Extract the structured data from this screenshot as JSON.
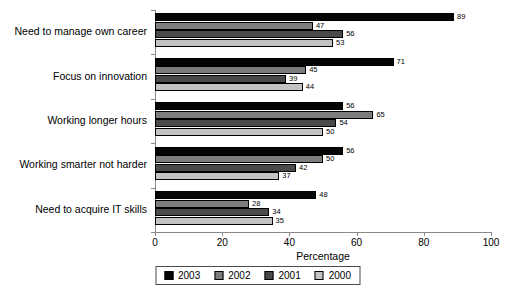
{
  "chart_data": {
    "type": "bar",
    "orientation": "horizontal",
    "title": "",
    "xlabel": "Percentage",
    "ylabel": "",
    "xlim": [
      0,
      100
    ],
    "xticks": [
      0,
      20,
      40,
      60,
      80,
      100
    ],
    "grid": false,
    "legend_position": "bottom",
    "categories": [
      "Need to manage own career",
      "Focus on innovation",
      "Working longer hours",
      "Working smarter not harder",
      "Need to acquire IT skills"
    ],
    "series": [
      {
        "name": "2003",
        "color": "#050505",
        "values": [
          89,
          71,
          56,
          56,
          48
        ]
      },
      {
        "name": "2002",
        "color": "#7d7d7d",
        "values": [
          47,
          45,
          65,
          50,
          28
        ]
      },
      {
        "name": "2001",
        "color": "#4a4a4a",
        "values": [
          56,
          39,
          54,
          42,
          34
        ]
      },
      {
        "name": "2000",
        "color": "#c3c3c3",
        "values": [
          53,
          44,
          50,
          37,
          35
        ]
      }
    ]
  },
  "legend": {
    "items": [
      {
        "label": "2003"
      },
      {
        "label": "2002"
      },
      {
        "label": "2001"
      },
      {
        "label": "2000"
      }
    ]
  }
}
